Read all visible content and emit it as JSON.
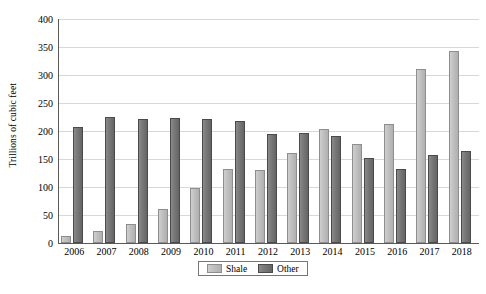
{
  "chart_data": {
    "type": "bar",
    "title": "",
    "subtitle": "",
    "xlabel": "",
    "ylabel": "Trillions of cubic feet",
    "ylim": [
      0,
      400
    ],
    "yticks": [
      0,
      50,
      100,
      150,
      200,
      250,
      300,
      350,
      400
    ],
    "grid": true,
    "legend_position": "bottom-center",
    "categories": [
      "2006",
      "2007",
      "2008",
      "2009",
      "2010",
      "2011",
      "2012",
      "2013",
      "2014",
      "2015",
      "2016",
      "2017",
      "2018"
    ],
    "series": [
      {
        "name": "Shale",
        "color": "#c2c2c2",
        "values": [
          13,
          22,
          34,
          60,
          98,
          132,
          130,
          161,
          203,
          176,
          213,
          310,
          343
        ]
      },
      {
        "name": "Other",
        "color": "#7a7a7a",
        "values": [
          207,
          225,
          221,
          223,
          221,
          218,
          194,
          196,
          191,
          151,
          133,
          158,
          164
        ]
      }
    ]
  },
  "legend": {
    "items": [
      {
        "label": "Shale",
        "swatch": "shale"
      },
      {
        "label": "Other",
        "swatch": "other"
      }
    ]
  }
}
